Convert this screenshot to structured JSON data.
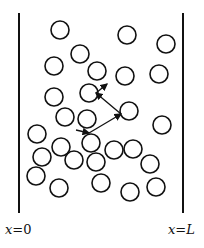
{
  "diagram": {
    "walls": {
      "left": {
        "x": 19,
        "y1": 13,
        "y2": 213,
        "label": "x=0"
      },
      "right": {
        "x": 183,
        "y1": 13,
        "y2": 213,
        "label": "x=L"
      }
    },
    "particle_radius": 9,
    "particles": [
      {
        "x": 60,
        "y": 30
      },
      {
        "x": 127,
        "y": 35
      },
      {
        "x": 166,
        "y": 44
      },
      {
        "x": 80,
        "y": 54
      },
      {
        "x": 54,
        "y": 66
      },
      {
        "x": 97,
        "y": 71
      },
      {
        "x": 125,
        "y": 76
      },
      {
        "x": 159,
        "y": 74
      },
      {
        "x": 54,
        "y": 97
      },
      {
        "x": 89,
        "y": 93
      },
      {
        "x": 129,
        "y": 111
      },
      {
        "x": 65,
        "y": 117
      },
      {
        "x": 87,
        "y": 119
      },
      {
        "x": 162,
        "y": 125
      },
      {
        "x": 37,
        "y": 134
      },
      {
        "x": 91,
        "y": 143
      },
      {
        "x": 61,
        "y": 147
      },
      {
        "x": 114,
        "y": 150
      },
      {
        "x": 133,
        "y": 149
      },
      {
        "x": 42,
        "y": 157
      },
      {
        "x": 74,
        "y": 160
      },
      {
        "x": 96,
        "y": 162
      },
      {
        "x": 150,
        "y": 164
      },
      {
        "x": 36,
        "y": 176
      },
      {
        "x": 59,
        "y": 188
      },
      {
        "x": 101,
        "y": 183
      },
      {
        "x": 130,
        "y": 192
      },
      {
        "x": 156,
        "y": 187
      }
    ],
    "path": [
      {
        "from": [
          76,
          130
        ],
        "to": [
          89,
          133
        ]
      },
      {
        "from": [
          89,
          133
        ],
        "to": [
          121,
          114
        ]
      },
      {
        "from": [
          121,
          114
        ],
        "to": [
          96,
          93
        ]
      },
      {
        "from": [
          96,
          93
        ],
        "to": [
          107,
          84
        ]
      }
    ],
    "labels": {
      "left": {
        "var": "x",
        "eq": "=",
        "val": "0"
      },
      "right": {
        "var": "x",
        "eq": "=",
        "val": "L"
      }
    }
  }
}
